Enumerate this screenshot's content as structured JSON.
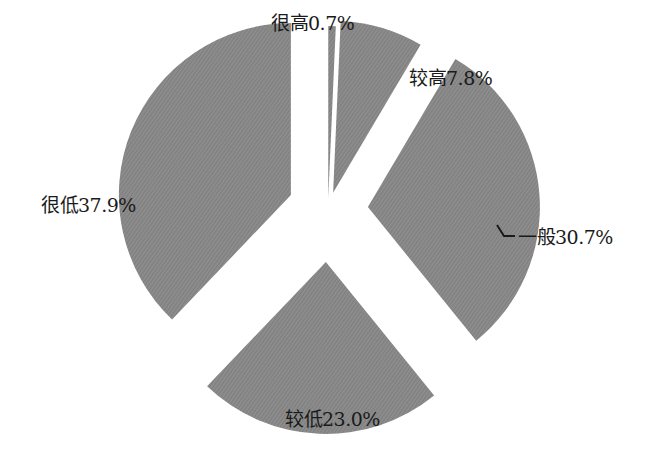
{
  "chart_data": {
    "type": "pie",
    "style": "exploded",
    "title": "",
    "slice_color": "#8a8a8a",
    "background": "#ffffff",
    "categories": [
      "很高",
      "较高",
      "一般",
      "较低",
      "很低"
    ],
    "values": [
      0.7,
      7.8,
      30.7,
      23.0,
      37.9
    ],
    "unit": "%",
    "labels": [
      "很高0.7%",
      "较高7.8%",
      "一般30.7%",
      "较低23.0%",
      "很低37.9%"
    ],
    "legend": "none"
  },
  "labels": {
    "very_high": "很高0.7%",
    "high": "较高7.8%",
    "medium": "一般30.7%",
    "low": "较低23.0%",
    "very_low": "很低37.9%"
  }
}
